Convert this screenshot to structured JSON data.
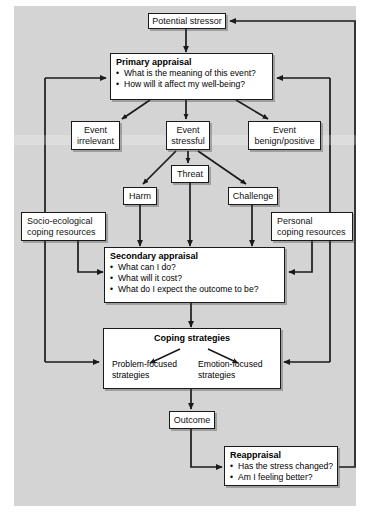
{
  "diagram": {
    "background_color": "#d4d4d4",
    "box_fill": "#ffffff",
    "line_color": "#1a1a1a"
  },
  "nodes": {
    "potential_stressor": {
      "label": "Potential stressor"
    },
    "primary_appraisal": {
      "heading": "Primary appraisal",
      "bullets": [
        "What is the meaning of this event?",
        "How will it affect my well-being?"
      ]
    },
    "event_irrelevant": {
      "line1": "Event",
      "line2": "irrelevant"
    },
    "event_stressful": {
      "line1": "Event",
      "line2": "stressful"
    },
    "event_benign": {
      "line1": "Event",
      "line2": "benign/positive"
    },
    "harm": {
      "label": "Harm"
    },
    "threat": {
      "label": "Threat"
    },
    "challenge": {
      "label": "Challenge"
    },
    "socio_ecological": {
      "line1": "Socio-ecological",
      "line2": "coping resources"
    },
    "personal_resources": {
      "line1": "Personal",
      "line2": "coping resources"
    },
    "secondary_appraisal": {
      "heading": "Secondary appraisal",
      "bullets": [
        "What can I do?",
        "What will it cost?",
        "What do I expect the outcome to be?"
      ]
    },
    "coping_strategies": {
      "heading": "Coping strategies",
      "problem_focused": "Problem-focused strategies",
      "problem_focused_line1": "Problem-focused",
      "problem_focused_line2": "strategies",
      "emotion_focused": "Emotion-focused strategies",
      "emotion_focused_line1": "Emotion-focused",
      "emotion_focused_line2": "strategies"
    },
    "outcome": {
      "label": "Outcome"
    },
    "reappraisal": {
      "heading": "Reappraisal",
      "bullets": [
        "Has the stress changed?",
        "Am I feeling better?"
      ]
    }
  }
}
